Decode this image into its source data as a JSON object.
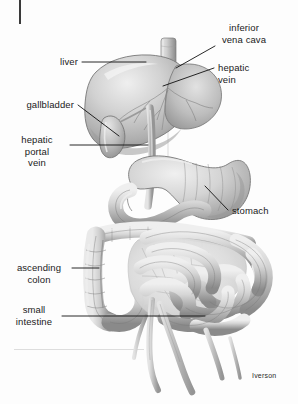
{
  "figure": {
    "signature": "Iverson",
    "top_clipped_text": "·  ·   ·  · ·  · · ··  · · ·",
    "background_color": "#fdfdfd",
    "ink_color": "#1a1a1a"
  },
  "labels": [
    {
      "id": "inferior-vena-cava",
      "text": "inferior\nvena cava",
      "align": "center"
    },
    {
      "id": "hepatic-vein",
      "text": "hepatic\nvein",
      "align": "left"
    },
    {
      "id": "liver",
      "text": "liver",
      "align": "right"
    },
    {
      "id": "gallbladder",
      "text": "gallbladder",
      "align": "right"
    },
    {
      "id": "hepatic-portal-vein",
      "text": "hepatic\nportal\nvein",
      "align": "center"
    },
    {
      "id": "stomach",
      "text": "stomach",
      "align": "left"
    },
    {
      "id": "ascending-colon",
      "text": "ascending\ncolon",
      "align": "center"
    },
    {
      "id": "small-intestine",
      "text": "small\nintestine",
      "align": "center"
    }
  ],
  "organs": [
    {
      "id": "liver",
      "name": "liver"
    },
    {
      "id": "gallbladder",
      "name": "gallbladder"
    },
    {
      "id": "inferior-vena-cava",
      "name": "inferior vena cava"
    },
    {
      "id": "hepatic-vein",
      "name": "hepatic vein"
    },
    {
      "id": "hepatic-portal-vein",
      "name": "hepatic portal vein"
    },
    {
      "id": "stomach",
      "name": "stomach"
    },
    {
      "id": "duodenum",
      "name": "duodenum"
    },
    {
      "id": "transverse-colon",
      "name": "transverse colon"
    },
    {
      "id": "ascending-colon",
      "name": "ascending colon"
    },
    {
      "id": "small-intestine",
      "name": "small intestine"
    },
    {
      "id": "mesenteric-vessels",
      "name": "mesenteric vessels"
    }
  ],
  "palette": {
    "organ_light": "#e8e8e8",
    "organ_mid": "#c2c2c2",
    "organ_dark": "#8e8e8e",
    "organ_shadow": "#6f6f6f",
    "outline": "#6b6b6b",
    "leader": "#111111"
  }
}
